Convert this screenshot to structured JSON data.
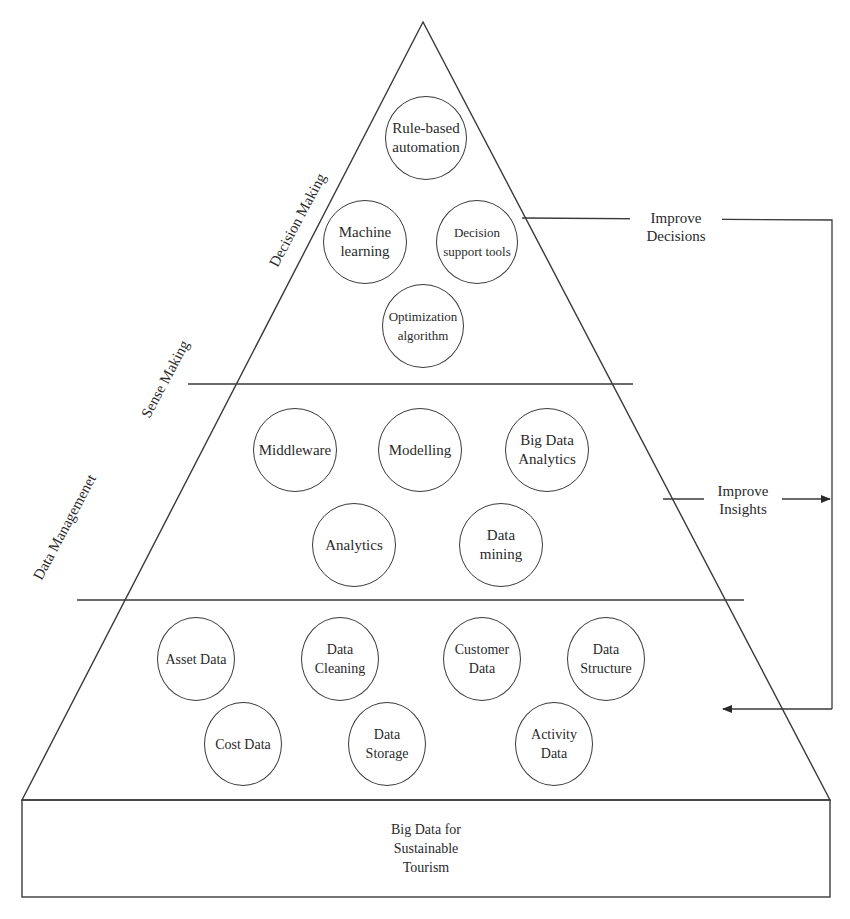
{
  "diagram": {
    "base": {
      "label": "Big Data for\nSustainable\nTourism"
    },
    "tiers": [
      {
        "name": "Decision Making",
        "nodes": [
          {
            "label": "Rule-based\nautomation"
          },
          {
            "label": "Machine\nlearning"
          },
          {
            "label": "Decision\nsupport tools"
          },
          {
            "label": "Optimization\nalgorithm"
          }
        ]
      },
      {
        "name": "Sense Making",
        "nodes": [
          {
            "label": "Middleware"
          },
          {
            "label": "Modelling"
          },
          {
            "label": "Big Data\nAnalytics"
          },
          {
            "label": "Analytics"
          },
          {
            "label": "Data\nmining"
          }
        ]
      },
      {
        "name": "Data Managemenet",
        "nodes": [
          {
            "label": "Asset Data"
          },
          {
            "label": "Data\nCleaning"
          },
          {
            "label": "Customer\nData"
          },
          {
            "label": "Data\nStructure"
          },
          {
            "label": "Cost Data"
          },
          {
            "label": "Data\nStorage"
          },
          {
            "label": "Activity\nData"
          }
        ]
      }
    ],
    "feedback": [
      {
        "label": "Improve\nDecisions"
      },
      {
        "label": "Improve\nInsights"
      }
    ],
    "colors": {
      "line": "#3a3a3a",
      "text": "#2a2a2a",
      "background": "#ffffff"
    }
  }
}
